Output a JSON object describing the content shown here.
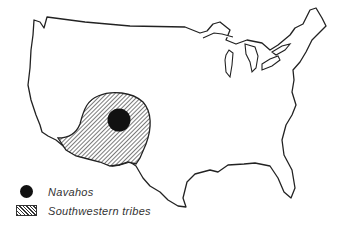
{
  "map": {
    "region": "Contiguous United States",
    "areas": [
      {
        "name": "Southwestern tribes",
        "pattern": "diagonal-hatch"
      },
      {
        "name": "Navahos",
        "pattern": "solid-black-dot"
      }
    ]
  },
  "legend": {
    "items": [
      {
        "label": "Navahos",
        "symbol": "black-dot"
      },
      {
        "label": "Southwestern tribes",
        "symbol": "hatched-box"
      }
    ]
  },
  "colors": {
    "outline": "#222222",
    "fill": "#111111",
    "background": "#ffffff"
  }
}
